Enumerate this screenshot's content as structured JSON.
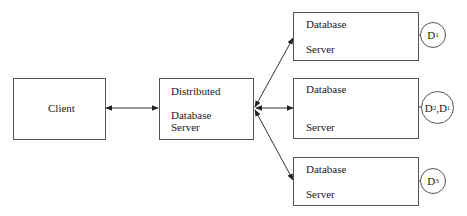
{
  "diagram": {
    "nodes": {
      "client": {
        "label": "Client"
      },
      "distributed": {
        "line1": "Distributed",
        "line2": "Database",
        "line3": "Server"
      },
      "db1": {
        "line1": "Database",
        "line2": "Server"
      },
      "db2": {
        "line1": "Database",
        "line2": "Server"
      },
      "db3": {
        "line1": "Database",
        "line2": "Server"
      }
    },
    "data_stores": {
      "d1": {
        "main": "D",
        "sub": "1"
      },
      "d2d1": {
        "main1": "D",
        "sub1": "2",
        "sep": ",",
        "main2": "D",
        "sub2": "1"
      },
      "d3": {
        "main": "D",
        "sub": "3"
      }
    },
    "edges": [
      {
        "from": "client",
        "to": "distributed",
        "type": "bidirectional"
      },
      {
        "from": "distributed",
        "to": "db1",
        "type": "bidirectional"
      },
      {
        "from": "distributed",
        "to": "db2",
        "type": "bidirectional"
      },
      {
        "from": "distributed",
        "to": "db3",
        "type": "bidirectional"
      },
      {
        "from": "db1",
        "to": "d1",
        "type": "line"
      },
      {
        "from": "db2",
        "to": "d2d1",
        "type": "line"
      },
      {
        "from": "db3",
        "to": "d3",
        "type": "line"
      }
    ]
  }
}
